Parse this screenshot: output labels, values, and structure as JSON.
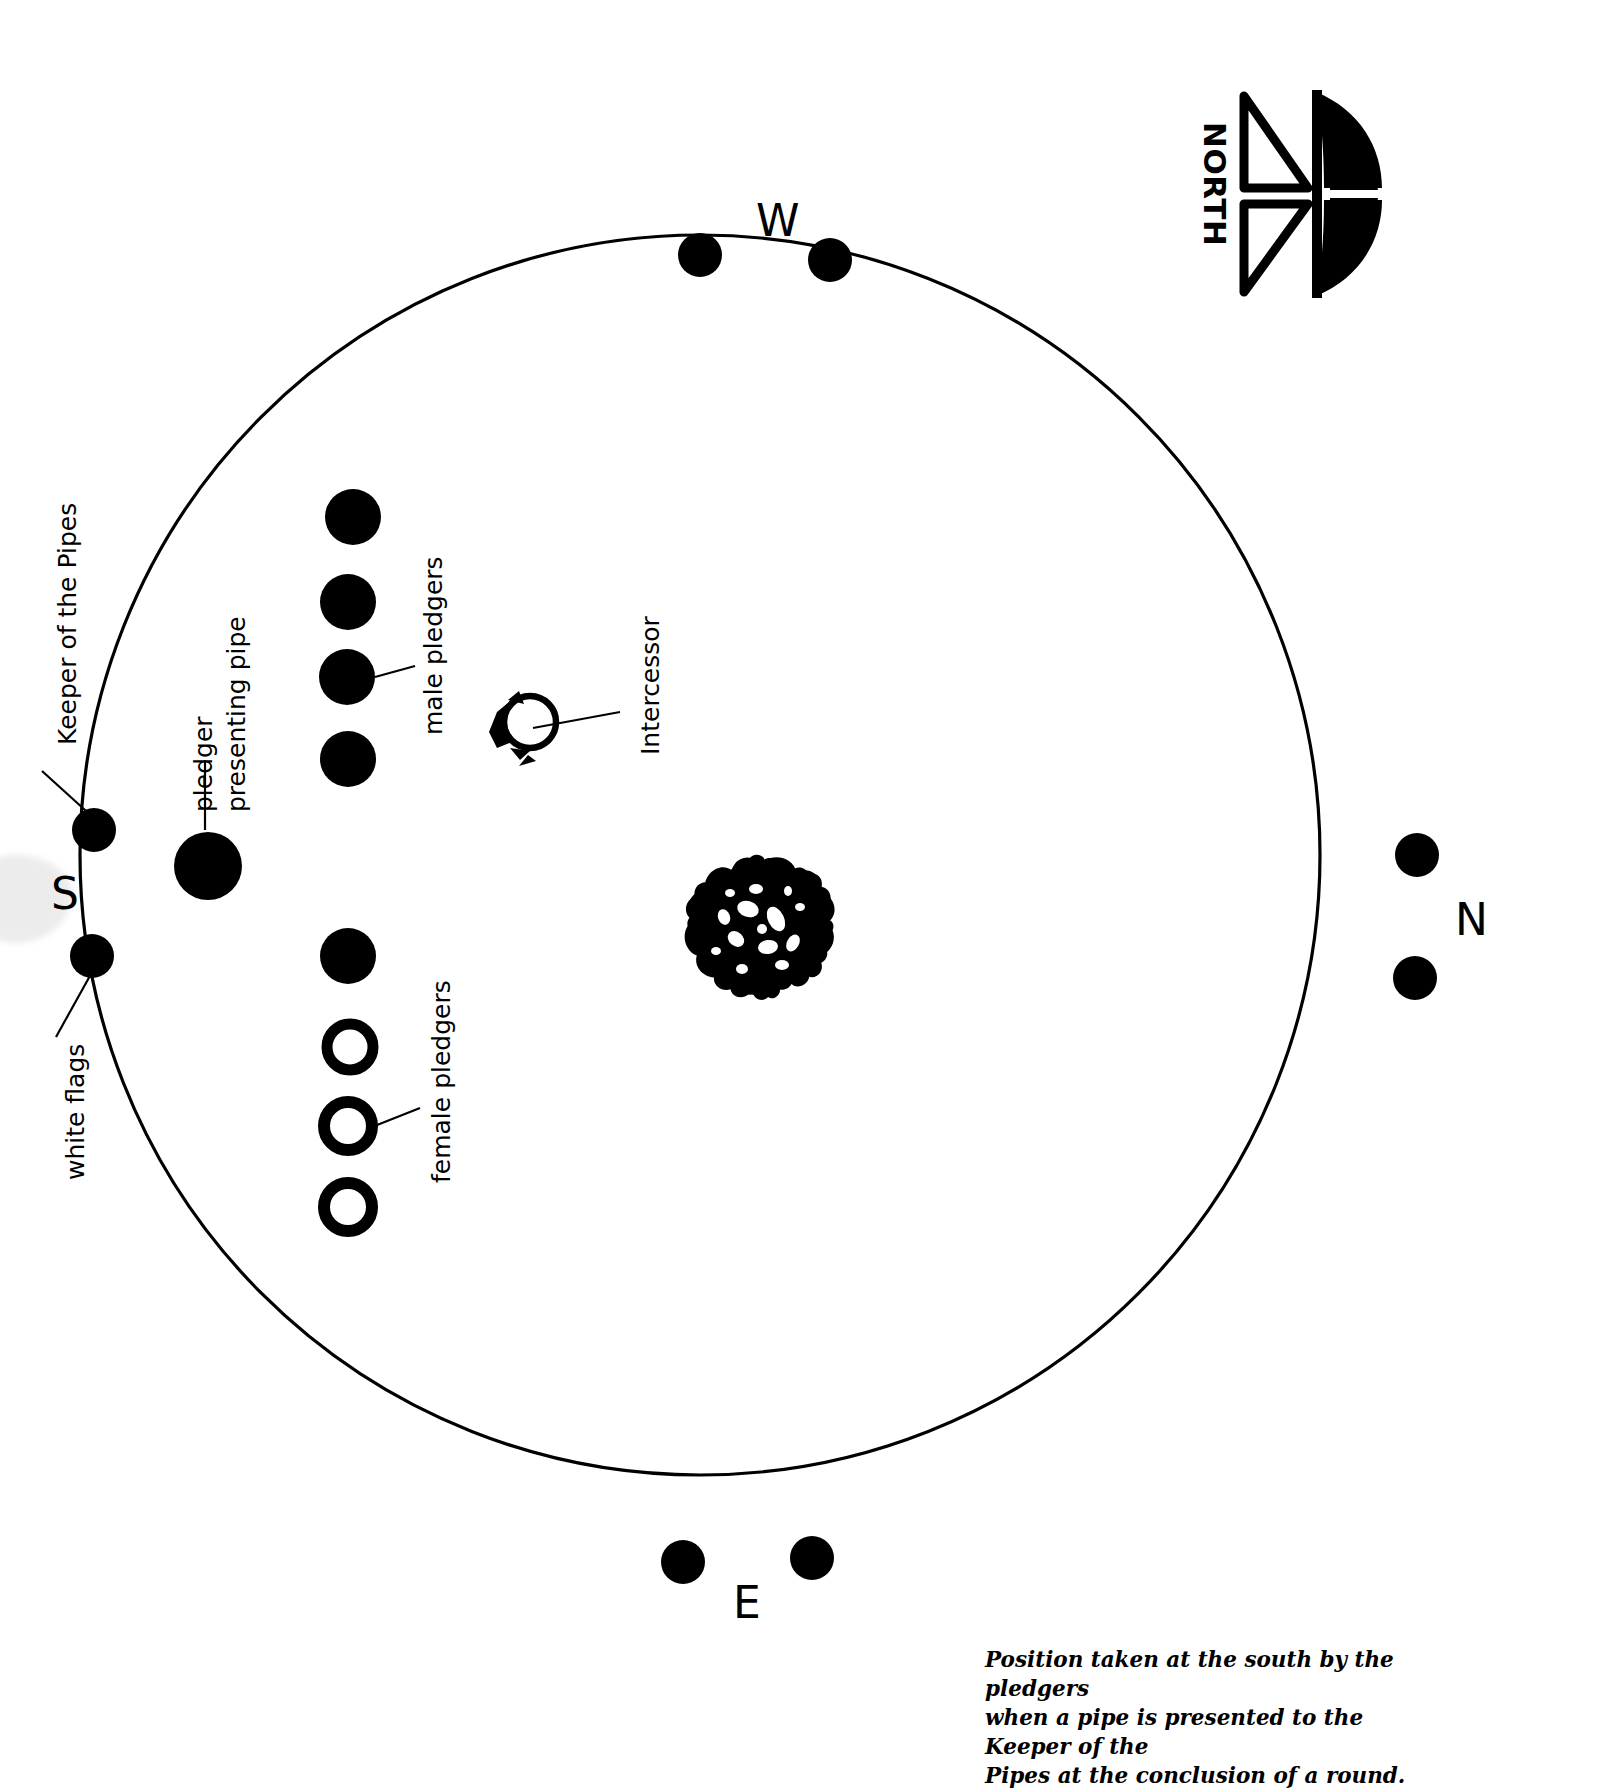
{
  "diagram": {
    "title_caption": "Position taken at the south by the pledgers when a pipe is presented to the Keeper of the Pipes at the conclusion of a round.",
    "caption_lines": [
      "Position taken at the south by the pledgers",
      "when a pipe is presented to the Keeper of the",
      "Pipes at the conclusion of a round."
    ],
    "compass": {
      "label": "NORTH",
      "icon": "compass-rose-icon"
    },
    "cardinals": [
      {
        "label": "W",
        "position": "top"
      },
      {
        "label": "N",
        "position": "right"
      },
      {
        "label": "E",
        "position": "bottom"
      },
      {
        "label": "S",
        "position": "left"
      }
    ],
    "annotations": [
      {
        "name": "keeper-of-the-pipes",
        "label": "Keeper of the Pipes"
      },
      {
        "name": "pledger-presenting-pipe",
        "label": "pledger\npresenting pipe"
      },
      {
        "name": "pledger-presenting-pipe-line1",
        "label": "pledger"
      },
      {
        "name": "pledger-presenting-pipe-line2",
        "label": "presenting pipe"
      },
      {
        "name": "male-pledgers",
        "label": "male pledgers"
      },
      {
        "name": "female-pledgers",
        "label": "female pledgers"
      },
      {
        "name": "white-flags",
        "label": "white flags"
      },
      {
        "name": "intercessor",
        "label": "Intercessor"
      }
    ],
    "legend_counts": {
      "male_pledgers": 5,
      "female_pledgers": 3,
      "pledger_presenting_pipe": 1,
      "white_flag_markers": 8,
      "intercessor": 1,
      "center_tree": 1
    },
    "colors": {
      "ink": "#000000",
      "background": "#ffffff",
      "smudge": "#ececec"
    },
    "elements": {
      "circle": {
        "name": "ceremonial-circle",
        "cx": 700,
        "cy": 855,
        "r": 620
      },
      "center_tree": {
        "name": "center-tree-icon",
        "cx": 760,
        "cy": 925,
        "r": 66
      },
      "intercessor_marker": {
        "name": "intercessor-marker",
        "cx": 528,
        "cy": 718,
        "r": 26
      }
    }
  }
}
